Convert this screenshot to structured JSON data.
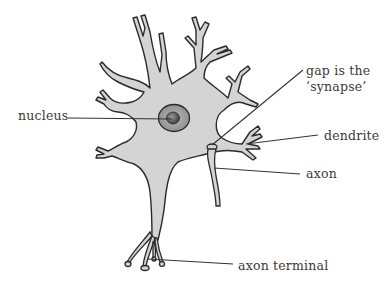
{
  "diagram": {
    "colors": {
      "cell_fill": "#d4d4d4",
      "outline": "#2a2a2a",
      "nucleus_outer": "#9c9c9c",
      "nucleus_inner": "#5e5e5e",
      "leader_line": "#333333",
      "label_text": "#3a3a3a",
      "background": "#ffffff"
    },
    "labels": {
      "nucleus": "nucleus",
      "synapse_line1": "gap is the",
      "synapse_line2": "‘synapse’",
      "dendrite": "dendrite",
      "axon": "axon",
      "axon_terminal": "axon terminal"
    }
  }
}
